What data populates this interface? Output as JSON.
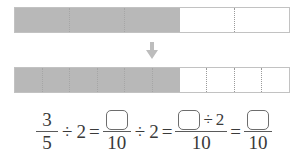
{
  "colors": {
    "shaded": "#b8b8b8",
    "unshaded": "#ffffff",
    "bar_border": "#c2c2c2",
    "divider": "#9a9a9a",
    "text": "#3a3a3a",
    "arrow": "#bdbdbd",
    "box_border": "#6d6d6d"
  },
  "models": {
    "top_bar": {
      "label": "three fifths bar model",
      "total_parts": 5,
      "shaded_parts": 3,
      "fraction": "3/5"
    },
    "arrow": {
      "icon": "arrow-down-icon",
      "direction": "down"
    },
    "bottom_bar": {
      "label": "six tenths bar model",
      "total_parts": 10,
      "shaded_parts": 6,
      "fraction": "6/10"
    }
  },
  "equation": {
    "statement": "3/5 ÷ 2 = ☐/10 ÷ 2 = (☐÷2)/10 = ☐/10",
    "term1": {
      "numerator": "3",
      "denominator": "5"
    },
    "op1": "÷",
    "divisor1": "2",
    "eq1": "=",
    "term2": {
      "numerator": "",
      "denominator": "10",
      "numerator_is_blank": true
    },
    "op2": "÷",
    "divisor2": "2",
    "eq2": "=",
    "term3": {
      "numerator_blank": "",
      "numerator_op": "÷",
      "numerator_divisor": "2",
      "denominator": "10"
    },
    "eq3": "=",
    "term4": {
      "numerator": "",
      "denominator": "10",
      "numerator_is_blank": true
    }
  }
}
